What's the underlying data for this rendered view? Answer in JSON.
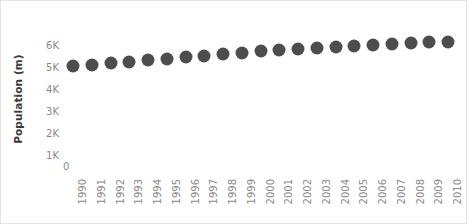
{
  "chart_data": {
    "type": "scatter",
    "title": "",
    "subtitle": "",
    "xlabel": "",
    "ylabel": "Population (m)",
    "grid": false,
    "legend": null,
    "marker": {
      "shape": "circle",
      "color": "#4d4d4d",
      "size_px": 13
    },
    "xlim": [
      1989.5,
      2010.5
    ],
    "ylim": [
      0,
      6500
    ],
    "y_ticks": [
      0,
      1000,
      2000,
      3000,
      4000,
      5000,
      6000
    ],
    "y_tick_labels": [
      "0",
      "1K",
      "2K",
      "3K",
      "4K",
      "5K",
      "6K"
    ],
    "x_tick_rotation": -90,
    "categories": [
      "1990",
      "1991",
      "1992",
      "1993",
      "1994",
      "1995",
      "1996",
      "1997",
      "1998",
      "1999",
      "2000",
      "2001",
      "2002",
      "2003",
      "2004",
      "2005",
      "2006",
      "2007",
      "2008",
      "2009",
      "2010"
    ],
    "values": [
      5050,
      5100,
      5170,
      5240,
      5310,
      5380,
      5450,
      5520,
      5590,
      5650,
      5710,
      5760,
      5810,
      5860,
      5910,
      5960,
      6000,
      6040,
      6080,
      6120,
      6150
    ],
    "series": [
      {
        "name": "Population",
        "values": [
          5050,
          5100,
          5170,
          5240,
          5310,
          5380,
          5450,
          5520,
          5590,
          5650,
          5710,
          5760,
          5810,
          5860,
          5910,
          5960,
          6000,
          6040,
          6080,
          6120,
          6150
        ]
      }
    ]
  },
  "axis": {
    "y_title": "Population (m)",
    "y_zero_label": "0"
  },
  "colors": {
    "marker": "#4d4d4d",
    "tick_text": "#8a8a8a",
    "axis_title": "#3a3a3a",
    "frame": "#e3e3e3",
    "background": "#ffffff"
  }
}
